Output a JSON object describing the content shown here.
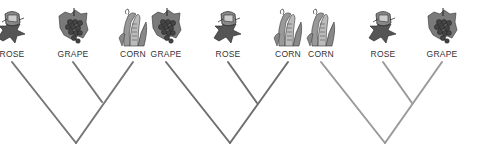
{
  "figure": {
    "type": "cladogram-comparison",
    "line_colors": [
      "#777777",
      "#6f6f6f",
      "#9a9a9a"
    ],
    "trees": [
      {
        "taxa": [
          {
            "label": "ROSE",
            "icon": "rose-icon",
            "x": 12
          },
          {
            "label": "GRAPE",
            "icon": "grape-icon",
            "x": 73
          },
          {
            "label": "CORN",
            "icon": "corn-icon",
            "x": 133
          }
        ],
        "root": {
          "x": 76,
          "y": 143
        },
        "inner_node": {
          "x": 102,
          "y": 102
        },
        "sister_pair": [
          "GRAPE",
          "CORN"
        ]
      },
      {
        "taxa": [
          {
            "label": "GRAPE",
            "icon": "grape-icon",
            "x": 166
          },
          {
            "label": "ROSE",
            "icon": "rose-icon",
            "x": 228
          },
          {
            "label": "CORN",
            "icon": "corn-icon",
            "x": 288
          }
        ],
        "root": {
          "x": 230,
          "y": 143
        },
        "inner_node": {
          "x": 257,
          "y": 103
        },
        "sister_pair": [
          "ROSE",
          "CORN"
        ]
      },
      {
        "taxa": [
          {
            "label": "CORN",
            "icon": "corn-icon",
            "x": 321
          },
          {
            "label": "ROSE",
            "icon": "rose-icon",
            "x": 383
          },
          {
            "label": "GRAPE",
            "icon": "grape-icon",
            "x": 442
          }
        ],
        "root": {
          "x": 385,
          "y": 143
        },
        "inner_node": {
          "x": 412,
          "y": 103
        },
        "sister_pair": [
          "ROSE",
          "GRAPE"
        ]
      }
    ]
  }
}
